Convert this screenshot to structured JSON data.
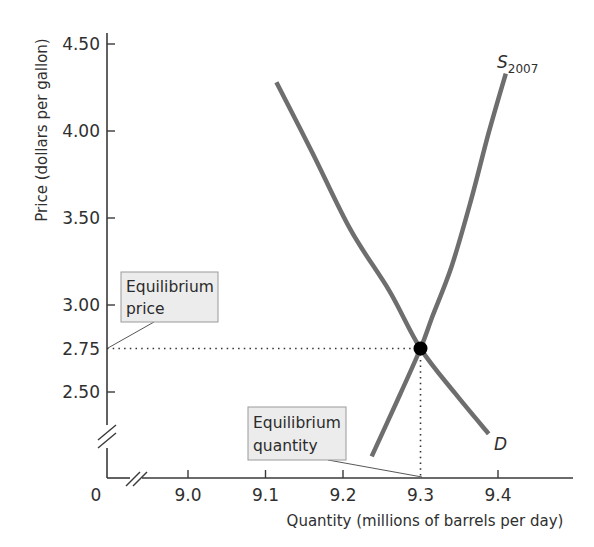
{
  "chart_data": {
    "type": "line",
    "title": "",
    "xlabel": "Quantity (millions of barrels per day)",
    "ylabel": "Price (dollars per gallon)",
    "x_origin_label": "0",
    "x_ticks": [
      "9.0",
      "9.1",
      "9.2",
      "9.3",
      "9.4"
    ],
    "x_tick_values": [
      9.0,
      9.1,
      9.2,
      9.3,
      9.4
    ],
    "y_ticks": [
      "2.50",
      "2.75",
      "3.00",
      "3.50",
      "4.00",
      "4.50"
    ],
    "y_tick_values": [
      2.5,
      2.75,
      3.0,
      3.5,
      4.0,
      4.5
    ],
    "xlim": [
      8.9,
      9.49
    ],
    "ylim": [
      2.1,
      4.55
    ],
    "axis_breaks": {
      "x": true,
      "y": true
    },
    "grid": false,
    "legend": "none (curves labeled directly)",
    "series": [
      {
        "name": "D",
        "label": "D",
        "kind": "demand",
        "color": "#6e6e6e",
        "points": [
          [
            9.114,
            4.28
          ],
          [
            9.16,
            3.88
          ],
          [
            9.21,
            3.43
          ],
          [
            9.26,
            3.08
          ],
          [
            9.3,
            2.75
          ],
          [
            9.345,
            2.49
          ],
          [
            9.388,
            2.26
          ]
        ]
      },
      {
        "name": "S2007",
        "label": "S",
        "label_subscript": "2007",
        "kind": "supply",
        "color": "#6e6e6e",
        "points": [
          [
            9.237,
            2.13
          ],
          [
            9.27,
            2.45
          ],
          [
            9.3,
            2.75
          ],
          [
            9.315,
            2.93
          ],
          [
            9.34,
            3.22
          ],
          [
            9.365,
            3.6
          ],
          [
            9.388,
            3.99
          ],
          [
            9.41,
            4.33
          ]
        ]
      }
    ],
    "equilibrium": {
      "quantity": 9.3,
      "price": 2.75
    },
    "annotations": [
      {
        "text_line1": "Equilibrium",
        "text_line2": "price",
        "points_to": "y-axis at 2.75"
      },
      {
        "text_line1": "Equilibrium",
        "text_line2": "quantity",
        "points_to": "x-axis at 9.3"
      }
    ]
  }
}
